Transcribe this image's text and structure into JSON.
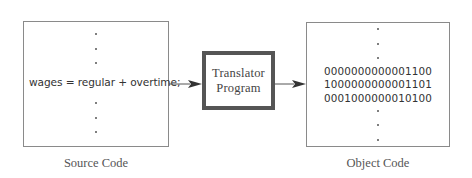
{
  "diagram": {
    "source": {
      "code_line": "wages = regular + overtime;",
      "caption": "Source Code",
      "ellipsis_above": [
        "·",
        "·",
        "·"
      ],
      "ellipsis_below": [
        "·",
        "·",
        "·"
      ]
    },
    "translator": {
      "line1": "Translator",
      "line2": "Program"
    },
    "object": {
      "binary_lines": [
        "0000000000001100",
        "1000000000001101",
        "0001000000010100"
      ],
      "caption": "Object Code",
      "ellipsis_above": [
        "·",
        "·",
        "·"
      ],
      "ellipsis_below": [
        "·",
        "·",
        "·"
      ]
    },
    "arrows": [
      {
        "from": "source",
        "to": "translator"
      },
      {
        "from": "translator",
        "to": "object"
      }
    ],
    "colors": {
      "box_border": "#8a8a8a",
      "translator_border": "#555555",
      "arrow": "#444444",
      "text": "#333333"
    }
  }
}
